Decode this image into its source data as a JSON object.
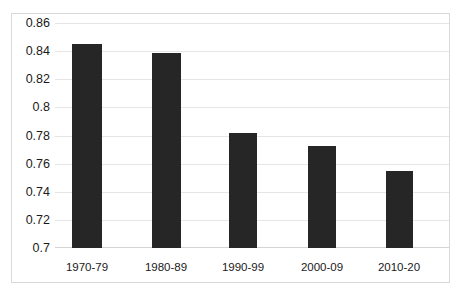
{
  "chart_data": {
    "type": "bar",
    "title": "",
    "subtitle": "",
    "xlabel": "",
    "ylabel": "",
    "categories": [
      "1970-79",
      "1980-89",
      "1990-99",
      "2000-09",
      "2010-20"
    ],
    "values": [
      0.845,
      0.8385,
      0.7815,
      0.7725,
      0.7545
    ],
    "series": [
      {
        "name": "",
        "values": [
          0.845,
          0.8385,
          0.7815,
          0.7725,
          0.7545
        ]
      }
    ],
    "ylim": [
      0.7,
      0.86
    ],
    "ytick_labels": [
      "0.86",
      "0.84",
      "0.82",
      "0.8",
      "0.78",
      "0.76",
      "0.74",
      "0.72",
      "0.7"
    ],
    "ytick_values": [
      0.86,
      0.84,
      0.82,
      0.8,
      0.78,
      0.76,
      0.74,
      0.72,
      0.7
    ],
    "grid": true,
    "legend": false,
    "legend_position": "none",
    "annotations": [],
    "colors": {
      "bar": "#262626",
      "gridline": "#e6e6e6",
      "frame": "#d9d9d9",
      "background": "#ffffff",
      "text": "#1a1a1a"
    }
  }
}
